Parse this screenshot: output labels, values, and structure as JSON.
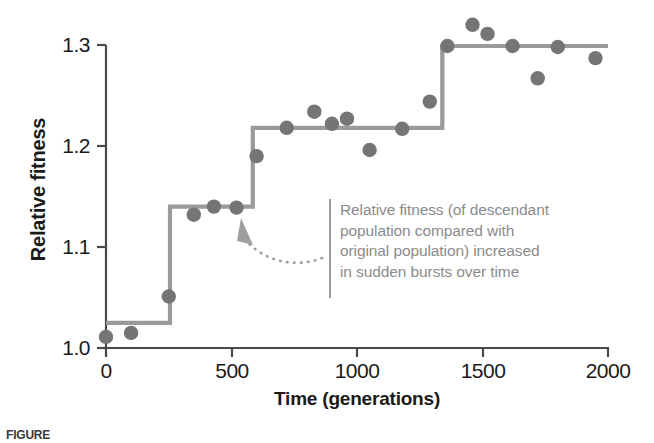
{
  "chart_data": {
    "type": "scatter",
    "title": "",
    "xlabel": "Time (generations)",
    "ylabel": "Relative fitness",
    "xlim": [
      0,
      2000
    ],
    "ylim": [
      1.0,
      1.3
    ],
    "xticks": [
      "0",
      "500",
      "1000",
      "1500",
      "2000"
    ],
    "xtick_values": [
      0,
      500,
      1000,
      1500,
      2000
    ],
    "yticks": [
      "1.0",
      "1.1",
      "1.2",
      "1.3"
    ],
    "ytick_values": [
      1.0,
      1.1,
      1.2,
      1.3
    ],
    "grid": false,
    "legend": "none",
    "series": [
      {
        "name": "Relative fitness measurements",
        "type": "scatter",
        "marker": "circle",
        "color": "#757575",
        "points": [
          {
            "x": 0,
            "y": 1.011
          },
          {
            "x": 100,
            "y": 1.015
          },
          {
            "x": 250,
            "y": 1.051
          },
          {
            "x": 350,
            "y": 1.132
          },
          {
            "x": 430,
            "y": 1.14
          },
          {
            "x": 520,
            "y": 1.139
          },
          {
            "x": 600,
            "y": 1.19
          },
          {
            "x": 720,
            "y": 1.218
          },
          {
            "x": 830,
            "y": 1.234
          },
          {
            "x": 900,
            "y": 1.222
          },
          {
            "x": 960,
            "y": 1.227
          },
          {
            "x": 1050,
            "y": 1.196
          },
          {
            "x": 1180,
            "y": 1.217
          },
          {
            "x": 1290,
            "y": 1.244
          },
          {
            "x": 1360,
            "y": 1.299
          },
          {
            "x": 1460,
            "y": 1.32
          },
          {
            "x": 1520,
            "y": 1.311
          },
          {
            "x": 1620,
            "y": 1.299
          },
          {
            "x": 1720,
            "y": 1.267
          },
          {
            "x": 1800,
            "y": 1.298
          },
          {
            "x": 1950,
            "y": 1.287
          }
        ]
      },
      {
        "name": "Fitted step function",
        "type": "step",
        "color": "#9a9a9a",
        "steps": [
          {
            "x_start": 0,
            "x_end": 255,
            "y": 1.025
          },
          {
            "x_start": 255,
            "x_end": 585,
            "y": 1.14
          },
          {
            "x_start": 585,
            "x_end": 1340,
            "y": 1.218
          },
          {
            "x_start": 1340,
            "x_end": 2000,
            "y": 1.299
          }
        ]
      }
    ]
  },
  "annotation": {
    "text": "Relative fitness (of descendant population compared with original population) increased in sudden bursts over time",
    "lines": [
      "Relative fitness (of descendant",
      "population compared with",
      "original population) increased",
      "in sudden bursts over time"
    ],
    "pointer": "dotted-curved-arrow",
    "color": "#8b8b8b"
  },
  "caption": {
    "text": "FIGURE"
  },
  "colors": {
    "marker": "#757575",
    "step_line": "#9a9a9a",
    "axis": "#4a4a4a",
    "text": "#1a1a1a",
    "annotation": "#8b8b8b",
    "background": "#ffffff"
  }
}
